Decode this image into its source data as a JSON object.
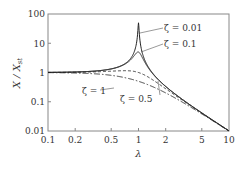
{
  "chart_data": {
    "type": "line",
    "title": "",
    "xlabel": "λ",
    "ylabel": "X / X_st",
    "xscale": "log",
    "yscale": "log",
    "xlim": [
      0.1,
      10
    ],
    "ylim": [
      0.01,
      100
    ],
    "grid": false,
    "legend": "inline annotations",
    "x_ticks": [
      0.1,
      0.2,
      0.5,
      1,
      2,
      5,
      10
    ],
    "x_tick_labels": [
      "0.1",
      "0.2",
      "0.5",
      "1",
      "2",
      "5",
      "10"
    ],
    "y_ticks": [
      0.01,
      0.1,
      1,
      10,
      100
    ],
    "y_tick_labels": [
      "0.01",
      "0.1",
      "1",
      "10",
      "100"
    ],
    "formula": "X/X_st = 1 / sqrt((1 - λ²)² + (2ζλ)²)",
    "series": [
      {
        "name": "ζ = 0.01",
        "zeta": 0.01,
        "style": "solid",
        "x": [
          0.1,
          0.2,
          0.5,
          0.8,
          0.9,
          0.95,
          1.0,
          1.05,
          1.1,
          1.2,
          1.5,
          2,
          5,
          10
        ],
        "values": [
          1.01,
          1.04,
          1.33,
          2.78,
          5.26,
          10.24,
          50.0,
          9.74,
          4.76,
          2.27,
          0.8,
          0.33,
          0.042,
          0.0101
        ]
      },
      {
        "name": "ζ = 0.1",
        "zeta": 0.1,
        "style": "solid",
        "x": [
          0.1,
          0.2,
          0.5,
          0.8,
          0.9,
          1.0,
          1.1,
          1.2,
          1.5,
          2,
          5,
          10
        ],
        "values": [
          1.01,
          1.04,
          1.32,
          2.57,
          3.75,
          5.0,
          3.29,
          2.07,
          0.78,
          0.33,
          0.042,
          0.0101
        ]
      },
      {
        "name": "ζ = 0.5",
        "zeta": 0.5,
        "style": "dashed",
        "x": [
          0.1,
          0.2,
          0.5,
          0.8,
          1.0,
          1.2,
          1.5,
          2,
          5,
          10
        ],
        "values": [
          1.0,
          1.02,
          1.11,
          1.14,
          1.0,
          0.8,
          0.53,
          0.28,
          0.041,
          0.0101
        ]
      },
      {
        "name": "ζ = 1",
        "zeta": 1,
        "style": "dash-dot",
        "x": [
          0.1,
          0.2,
          0.5,
          1.0,
          2,
          5,
          10
        ],
        "values": [
          0.99,
          0.96,
          0.8,
          0.5,
          0.2,
          0.038,
          0.0099
        ]
      }
    ],
    "annotations": [
      {
        "text": "ζ = 0.01",
        "points_to": "peak of ζ=0.01 curve"
      },
      {
        "text": "ζ = 0.1",
        "points_to": "ζ=0.1 curve near λ=1"
      },
      {
        "text": "ζ = 1",
        "points_to": "ζ=1 curve near λ=0.7"
      },
      {
        "text": "ζ = 0.5",
        "points_to": "ζ=0.5 curve near λ=1.2"
      }
    ]
  },
  "labels": {
    "xlabel": "λ",
    "ylabel_main": "X / X",
    "ylabel_sub": "st",
    "x_ticks": [
      "0.1",
      "0.2",
      "0.5",
      "1",
      "2",
      "5",
      "10"
    ],
    "y_ticks": [
      "0.01",
      "0.1",
      "1",
      "10",
      "100"
    ],
    "annot_001": "ζ = 0.01",
    "annot_01": "ζ = 0.1",
    "annot_1": "ζ = 1",
    "annot_05": "ζ = 0.5"
  }
}
